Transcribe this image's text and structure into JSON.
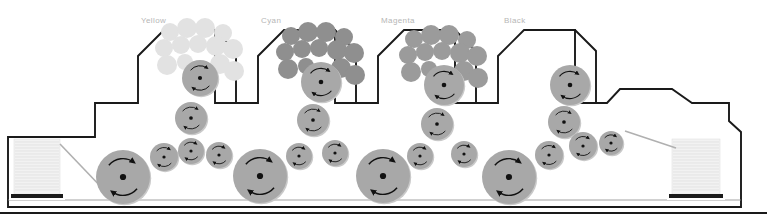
{
  "diagram": {
    "type": "press-schematic",
    "canvas": {
      "width": 767,
      "height": 223
    },
    "colors": {
      "frame_line": "#1a1a1a",
      "cylinder_fill": "#a8a8a8",
      "cylinder_shadow": "#c9c9c9",
      "journal_dot": "#111111",
      "arrow": "#111111",
      "paper_stack": "#f0f0f0",
      "paper_stripe": "#dcdcdc",
      "stack_base": "#1a1a1a",
      "label_text": "#b6b6b6",
      "ink_yellow": "#e2e2e2",
      "ink_cyan": "#8f8f8f",
      "ink_magenta": "#9b9b9b",
      "ink_black": "#0d0d0d",
      "background": "#ffffff"
    },
    "units": [
      {
        "id": "yellow",
        "label": "Yellow",
        "label_x": 141,
        "label_y": 16,
        "ink_color": "#e2e2e2",
        "tower_x": 136
      },
      {
        "id": "cyan",
        "label": "Cyan",
        "label_x": 261,
        "label_y": 16,
        "ink_color": "#8f8f8f",
        "tower_x": 256
      },
      {
        "id": "magenta",
        "label": "Magenta",
        "label_x": 381,
        "label_y": 16,
        "ink_color": "#9b9b9b",
        "tower_x": 376
      },
      {
        "id": "black",
        "label": "Black",
        "label_x": 504,
        "label_y": 16,
        "ink_color": "#0d0d0d",
        "tower_x": 496
      }
    ],
    "feeder": {
      "name": "feeder-paper-stack",
      "x": 14,
      "y": 139,
      "width": 46,
      "height": 55
    },
    "delivery": {
      "name": "delivery-paper-stack",
      "x": 672,
      "y": 139,
      "width": 48,
      "height": 55
    },
    "cylinders": [
      {
        "name": "impression-cylinder-1",
        "cx": 123,
        "cy": 177,
        "r": 27,
        "role": "impression"
      },
      {
        "name": "transfer-drum-1",
        "cx": 164,
        "cy": 157,
        "r": 14,
        "role": "transfer"
      },
      {
        "name": "transfer-drum-2",
        "cx": 191,
        "cy": 151,
        "r": 13,
        "role": "transfer"
      },
      {
        "name": "blanket-cylinder-y",
        "cx": 191,
        "cy": 118,
        "r": 16,
        "role": "blanket"
      },
      {
        "name": "plate-cylinder-y",
        "cx": 200,
        "cy": 78,
        "r": 18,
        "role": "plate"
      },
      {
        "name": "transfer-drum-3",
        "cx": 219,
        "cy": 155,
        "r": 13,
        "role": "transfer"
      },
      {
        "name": "impression-cylinder-2",
        "cx": 260,
        "cy": 176,
        "r": 27,
        "role": "impression"
      },
      {
        "name": "transfer-drum-4",
        "cx": 299,
        "cy": 156,
        "r": 13,
        "role": "transfer"
      },
      {
        "name": "blanket-cylinder-c",
        "cx": 313,
        "cy": 120,
        "r": 16,
        "role": "blanket"
      },
      {
        "name": "plate-cylinder-c",
        "cx": 321,
        "cy": 82,
        "r": 20,
        "role": "plate"
      },
      {
        "name": "transfer-drum-5",
        "cx": 335,
        "cy": 153,
        "r": 13,
        "role": "transfer"
      },
      {
        "name": "impression-cylinder-3",
        "cx": 383,
        "cy": 176,
        "r": 27,
        "role": "impression"
      },
      {
        "name": "transfer-drum-6",
        "cx": 420,
        "cy": 156,
        "r": 13,
        "role": "transfer"
      },
      {
        "name": "blanket-cylinder-m",
        "cx": 437,
        "cy": 124,
        "r": 16,
        "role": "blanket"
      },
      {
        "name": "plate-cylinder-m",
        "cx": 444,
        "cy": 85,
        "r": 20,
        "role": "plate"
      },
      {
        "name": "transfer-drum-7",
        "cx": 464,
        "cy": 154,
        "r": 13,
        "role": "transfer"
      },
      {
        "name": "impression-cylinder-4",
        "cx": 509,
        "cy": 177,
        "r": 27,
        "role": "impression"
      },
      {
        "name": "transfer-drum-8",
        "cx": 549,
        "cy": 155,
        "r": 14,
        "role": "transfer"
      },
      {
        "name": "blanket-cylinder-k",
        "cx": 564,
        "cy": 122,
        "r": 16,
        "role": "blanket"
      },
      {
        "name": "plate-cylinder-k",
        "cx": 570,
        "cy": 85,
        "r": 20,
        "role": "plate"
      },
      {
        "name": "transfer-drum-9",
        "cx": 583,
        "cy": 146,
        "r": 14,
        "role": "transfer"
      },
      {
        "name": "transfer-drum-10",
        "cx": 611,
        "cy": 143,
        "r": 12,
        "role": "transfer"
      }
    ],
    "ink_trains": {
      "description": "Cluster of ink distribution rollers above each plate cylinder, tinted with that unit's ink colour",
      "roller_offsets": [
        {
          "dx": -30,
          "dy": -46,
          "r": 9
        },
        {
          "dx": -13,
          "dy": -50,
          "r": 10
        },
        {
          "dx": 5,
          "dy": -50,
          "r": 10
        },
        {
          "dx": 23,
          "dy": -45,
          "r": 9
        },
        {
          "dx": -36,
          "dy": -30,
          "r": 9
        },
        {
          "dx": -19,
          "dy": -33,
          "r": 9
        },
        {
          "dx": -2,
          "dy": -34,
          "r": 9
        },
        {
          "dx": 16,
          "dy": -32,
          "r": 10
        },
        {
          "dx": 33,
          "dy": -29,
          "r": 10
        },
        {
          "dx": -33,
          "dy": -13,
          "r": 10
        },
        {
          "dx": -15,
          "dy": -16,
          "r": 8
        },
        {
          "dx": 20,
          "dy": -14,
          "r": 10
        },
        {
          "dx": 34,
          "dy": -7,
          "r": 10
        }
      ]
    },
    "frame": {
      "name": "press-frame-outline",
      "baseline_y": 207,
      "floor_y": 213
    },
    "sheet_path": {
      "feed_line": "diagonal from feeder stack top to first impression cylinder",
      "delivery_line": "diagonal from last transfer drum down to delivery stack"
    }
  }
}
